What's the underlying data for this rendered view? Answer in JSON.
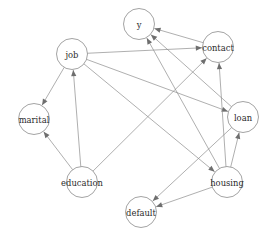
{
  "diagram": {
    "type": "directed-acyclic-graph",
    "width": 271,
    "height": 233,
    "background_color": "#ffffff",
    "node_stroke_color": "#8c8c8c",
    "edge_color": "#8c8c8c",
    "arrow_color": "#6e6e6e",
    "label_color": "#2b2b2b"
  },
  "nodes": [
    {
      "id": "y",
      "label": "y",
      "cx": 139,
      "cy": 24,
      "r": 15.5
    },
    {
      "id": "contact",
      "label": "contact",
      "cx": 218,
      "cy": 47,
      "r": 15.5
    },
    {
      "id": "job",
      "label": "job",
      "cx": 72,
      "cy": 54,
      "r": 15.5
    },
    {
      "id": "marital",
      "label": "marital",
      "cx": 34,
      "cy": 119,
      "r": 15.5
    },
    {
      "id": "loan",
      "label": "loan",
      "cx": 243,
      "cy": 117,
      "r": 15.5
    },
    {
      "id": "education",
      "label": "education",
      "cx": 82,
      "cy": 182,
      "r": 15.5
    },
    {
      "id": "housing",
      "label": "housing",
      "cx": 227,
      "cy": 182,
      "r": 15.5
    },
    {
      "id": "default",
      "label": "default",
      "cx": 141,
      "cy": 212,
      "r": 15.5
    }
  ],
  "edges": [
    {
      "from": "education",
      "to": "job",
      "directed": true
    },
    {
      "from": "job",
      "to": "marital",
      "directed": true
    },
    {
      "from": "education",
      "to": "marital",
      "directed": true
    },
    {
      "from": "job",
      "to": "loan",
      "directed": true
    },
    {
      "from": "job",
      "to": "housing",
      "directed": true
    },
    {
      "from": "job",
      "to": "contact",
      "directed": true
    },
    {
      "from": "education",
      "to": "contact",
      "directed": true
    },
    {
      "from": "contact",
      "to": "y",
      "directed": true
    },
    {
      "from": "loan",
      "to": "y",
      "directed": true
    },
    {
      "from": "housing",
      "to": "y",
      "directed": true
    },
    {
      "from": "housing",
      "to": "contact",
      "directed": true
    },
    {
      "from": "housing",
      "to": "loan",
      "directed": true
    },
    {
      "from": "housing",
      "to": "default",
      "directed": true
    },
    {
      "from": "loan",
      "to": "default",
      "directed": true
    }
  ]
}
